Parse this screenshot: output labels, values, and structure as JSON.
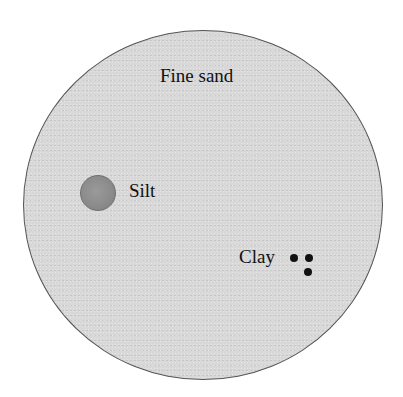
{
  "diagram": {
    "particles": [
      {
        "name": "fine-sand",
        "label": "Fine sand",
        "shape": "large circle",
        "fill": "#d8d8d8",
        "stroke": "#555555"
      },
      {
        "name": "silt",
        "label": "Silt",
        "shape": "medium circle",
        "fill": "#8a8a8a"
      },
      {
        "name": "clay",
        "label": "Clay",
        "shape": "tiny dots",
        "count": 3,
        "fill": "#111111"
      }
    ]
  },
  "labels": {
    "fine_sand": "Fine sand",
    "silt": "Silt",
    "clay": "Clay"
  }
}
